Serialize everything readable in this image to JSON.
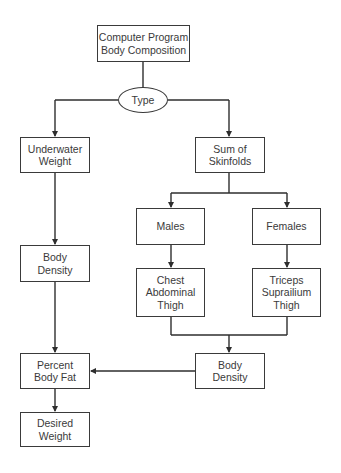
{
  "caption_fragment": "",
  "nodes": {
    "root": {
      "lines": [
        "Computer Program",
        "Body Composition"
      ]
    },
    "type": {
      "lines": [
        "Type"
      ]
    },
    "underwater": {
      "lines": [
        "Underwater",
        "Weight"
      ]
    },
    "skinfolds": {
      "lines": [
        "Sum of",
        "Skinfolds"
      ]
    },
    "males": {
      "lines": [
        "Males"
      ]
    },
    "females": {
      "lines": [
        "Females"
      ]
    },
    "male_sites": {
      "lines": [
        "Chest",
        "Abdominal",
        "Thigh"
      ]
    },
    "female_sites": {
      "lines": [
        "Triceps",
        "Suprailium",
        "Thigh"
      ]
    },
    "density_left": {
      "lines": [
        "Body",
        "Density"
      ]
    },
    "density_right": {
      "lines": [
        "Body",
        "Density"
      ]
    },
    "percent_fat": {
      "lines": [
        "Percent",
        "Body Fat"
      ]
    },
    "desired_weight": {
      "lines": [
        "Desired",
        "Weight"
      ]
    }
  },
  "edges": [
    {
      "from": "root",
      "to": "type"
    },
    {
      "from": "type",
      "to": "underwater"
    },
    {
      "from": "type",
      "to": "skinfolds"
    },
    {
      "from": "skinfolds",
      "to": "males"
    },
    {
      "from": "skinfolds",
      "to": "females"
    },
    {
      "from": "males",
      "to": "male_sites"
    },
    {
      "from": "females",
      "to": "female_sites"
    },
    {
      "from": "male_sites",
      "to": "density_right"
    },
    {
      "from": "female_sites",
      "to": "density_right"
    },
    {
      "from": "underwater",
      "to": "density_left"
    },
    {
      "from": "density_left",
      "to": "percent_fat"
    },
    {
      "from": "density_right",
      "to": "percent_fat"
    },
    {
      "from": "percent_fat",
      "to": "desired_weight"
    }
  ],
  "colors": {
    "stroke": "#2e2e2e",
    "background": "#ffffff"
  }
}
